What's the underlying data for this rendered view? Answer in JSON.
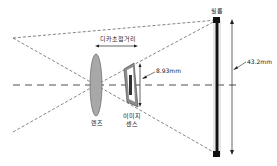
{
  "diagram": {
    "labels": {
      "focal_length": "디카초점거리",
      "lens": "렌즈",
      "image_sensor_line1": "이미지",
      "image_sensor_line2": "센스",
      "film": "필름",
      "sensor_size": "8.93mm",
      "film_size": "43.2mm"
    },
    "colors": {
      "lens_fill": "#a8a8a8",
      "sensor_outer": "#8c8c8c",
      "sensor_inner": "#ffffff",
      "sensor_core": "#333333",
      "line": "#222222",
      "film": "#111111"
    }
  }
}
